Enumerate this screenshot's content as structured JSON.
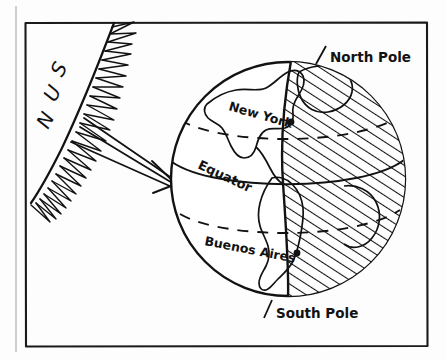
{
  "figure": {
    "type": "hand-drawn-diagram",
    "background_color": "#fdfdfd",
    "ink_color": "#121212",
    "frame": {
      "name": "diagram-border",
      "x": 24,
      "y": 22,
      "width": 404,
      "height": 325,
      "outer_edge_x": 16
    }
  },
  "labels": {
    "sun": "SUN",
    "sun_letters": [
      "S",
      "U",
      "N"
    ],
    "north_pole": "North Pole",
    "south_pole": "South Pole",
    "equator": "Equator",
    "new_york": "New York",
    "buenos_aires": "Buenos Aires"
  },
  "sun": {
    "name": "sun-body",
    "description": "Large spiked sun arc at the left edge of the frame",
    "ray_count": 3,
    "ray_label": "sunlight-rays",
    "arrow_tip": {
      "x": 174,
      "y": 183
    }
  },
  "globe": {
    "name": "earth-globe",
    "center_x": 288,
    "center_y": 179,
    "radius": 118,
    "lit_side": "west",
    "shaded_side": "east",
    "shading_style": "diagonal-hatching",
    "terminator_label": "day-night-terminator",
    "latitude_lines": [
      "tropic-north-dashed",
      "equator-solid",
      "tropic-south-dashed"
    ],
    "cities": [
      {
        "name": "New York",
        "dot_x": 291,
        "dot_y": 122
      },
      {
        "name": "Buenos Aires",
        "dot_x": 297,
        "dot_y": 253
      }
    ],
    "poles": [
      {
        "name": "North Pole",
        "x": 288,
        "y": 61
      },
      {
        "name": "South Pole",
        "x": 288,
        "y": 297
      }
    ]
  }
}
